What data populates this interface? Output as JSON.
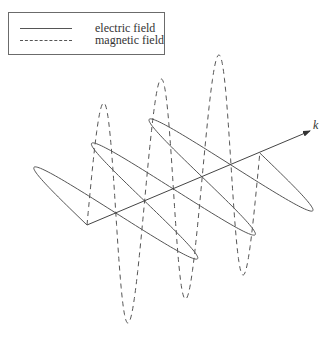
{
  "legend": {
    "items": [
      {
        "label": "electric field",
        "style": "solid"
      },
      {
        "label": "magnetic field",
        "style": "dashed"
      }
    ]
  },
  "axis": {
    "label": "k",
    "origin": [
      87,
      225
    ],
    "end": [
      310,
      131
    ],
    "label_pos": [
      313,
      118
    ]
  },
  "wave": {
    "half_wavelength_step": [
      28.8,
      -12.0
    ],
    "half_periods": 6,
    "electric_amplitude_vector": [
      -67,
      -52
    ],
    "magnetic_amplitude_vector": [
      2,
      -116
    ],
    "line_color": "#555555"
  }
}
